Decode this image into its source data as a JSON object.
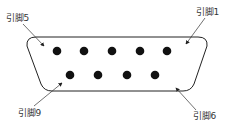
{
  "diagram": {
    "type": "DB9 connector pinout",
    "stroke_color": "#222222",
    "pin_color": "#111111",
    "labels": {
      "pin5": "引脚5",
      "pin1": "引脚1",
      "pin9": "引脚9",
      "pin6": "引脚6"
    },
    "top_row_pins": [
      5,
      4,
      3,
      2,
      1
    ],
    "bottom_row_pins": [
      9,
      8,
      7,
      6
    ]
  }
}
